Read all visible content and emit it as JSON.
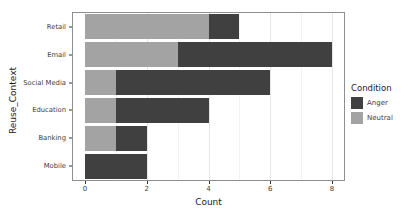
{
  "chart_data": {
    "type": "bar",
    "orientation": "horizontal",
    "stacked": true,
    "title": "",
    "xlabel": "Count",
    "ylabel": "Reuse_Context",
    "categories": [
      "Retail",
      "Email",
      "Social Media",
      "Education",
      "Banking",
      "Mobile"
    ],
    "series": [
      {
        "name": "Anger",
        "color": "#404040",
        "values": [
          1,
          5,
          5,
          3,
          1,
          2
        ]
      },
      {
        "name": "Neutral",
        "color": "#a3a3a3",
        "values": [
          4,
          3,
          1,
          1,
          1,
          0
        ]
      }
    ],
    "stack_order": [
      "Neutral",
      "Anger"
    ],
    "totals": [
      5,
      8,
      6,
      4,
      2,
      2
    ],
    "xlim": [
      0,
      8
    ],
    "xticks": [
      0,
      2,
      4,
      6,
      8
    ],
    "grid": true,
    "legend_title": "Condition",
    "legend_position": "right",
    "panel_border_color": "#8f8f8f",
    "grid_major_color": "#e6e6e6",
    "grid_minor_color": "#f3f3f3",
    "axis_text_color": "#404040"
  }
}
